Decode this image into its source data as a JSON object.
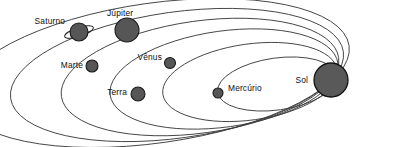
{
  "diagram": {
    "type": "solar-system-orbit-diagram",
    "colors": {
      "background": "#ffffff",
      "orbit_stroke": "#3d3d3d",
      "planet_fill": "#565656",
      "planet_stroke": "#1a1a1a",
      "sun_fill": "#595959",
      "label_text": "#101010"
    },
    "bodies": [
      {
        "id": "sol",
        "label": "Sol",
        "label_x": 308,
        "label_y": 83,
        "label_anchor": "end",
        "cx": 331,
        "cy": 80,
        "r": 17,
        "has_ring": false,
        "orbit_index": null
      },
      {
        "id": "mercurio",
        "label": "Mercúrio",
        "label_x": 228,
        "label_y": 91,
        "label_anchor": "start",
        "cx": 218,
        "cy": 93,
        "r": 5,
        "has_ring": false,
        "orbit_index": 0
      },
      {
        "id": "venus",
        "label": "Vênus",
        "label_x": 162,
        "label_y": 60,
        "label_anchor": "end",
        "cx": 170,
        "cy": 63,
        "r": 5.5,
        "has_ring": false,
        "orbit_index": 1
      },
      {
        "id": "terra",
        "label": "Terra",
        "label_x": 127,
        "label_y": 95,
        "label_anchor": "end",
        "cx": 138,
        "cy": 94,
        "r": 7,
        "has_ring": false,
        "orbit_index": 2
      },
      {
        "id": "marte",
        "label": "Marte",
        "label_x": 83,
        "label_y": 68,
        "label_anchor": "end",
        "cx": 92,
        "cy": 66,
        "r": 6,
        "has_ring": false,
        "orbit_index": 3
      },
      {
        "id": "jupiter",
        "label": "Júpiter",
        "label_x": 107,
        "label_y": 16,
        "label_anchor": "start",
        "cx": 127,
        "cy": 30,
        "r": 12,
        "has_ring": false,
        "orbit_index": 4
      },
      {
        "id": "saturno",
        "label": "Saturno",
        "label_x": 65,
        "label_y": 24,
        "label_anchor": "end",
        "cx": 79,
        "cy": 32,
        "r": 9,
        "has_ring": true,
        "ring_rx": 15,
        "ring_ry": 4.5,
        "ring_rotation": -18,
        "orbit_index": 5
      }
    ],
    "orbits": [
      {
        "id": "orbit-mercurio",
        "body": "mercurio",
        "rx": 60,
        "ry": 26,
        "cx": 277,
        "cy": 84,
        "rotation": -8
      },
      {
        "id": "orbit-venus",
        "body": "venus",
        "rx": 88,
        "ry": 38,
        "cx": 250,
        "cy": 82,
        "rotation": -8
      },
      {
        "id": "orbit-terra",
        "body": "terra",
        "rx": 115,
        "ry": 48,
        "cx": 224,
        "cy": 79,
        "rotation": -8
      },
      {
        "id": "orbit-marte",
        "body": "marte",
        "rx": 140,
        "ry": 56,
        "cx": 200,
        "cy": 77,
        "rotation": -8
      },
      {
        "id": "orbit-jupiter",
        "body": "jupiter",
        "rx": 168,
        "ry": 63,
        "cx": 177,
        "cy": 75,
        "rotation": -8
      },
      {
        "id": "orbit-saturno",
        "body": "saturno",
        "rx": 196,
        "ry": 70,
        "cx": 155,
        "cy": 73,
        "rotation": -8
      }
    ]
  }
}
